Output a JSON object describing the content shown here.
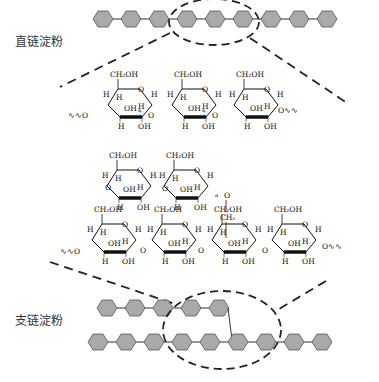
{
  "labels": {
    "amylose": "直链淀粉",
    "amylopectin": "支链淀粉"
  },
  "colors": {
    "hexagon_fill": "#a9a9a9",
    "hexagon_stroke": "#555555",
    "line": "#222222"
  },
  "amylose_chain": {
    "units": 9
  },
  "amylopectin_chain": {
    "main_units": 9,
    "branch_units": 5
  },
  "chem": {
    "ch2oh": "CH₂OH",
    "oh": "OH",
    "h": "H",
    "o": "O",
    "ch2": "CH₂",
    "alpha": "α",
    "wavy": "∿∿"
  }
}
